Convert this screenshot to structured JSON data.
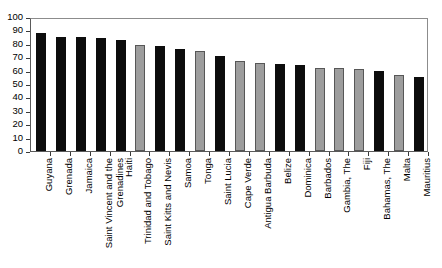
{
  "chart_data": {
    "type": "bar",
    "title": "",
    "subtitle": "",
    "xlabel": "",
    "ylabel": "",
    "ylim": [
      0,
      100
    ],
    "ytick_step": 10,
    "yticks": [
      100,
      90,
      80,
      70,
      60,
      50,
      40,
      30,
      20,
      10,
      0
    ],
    "grid": false,
    "legend": "none",
    "orientation": "vertical",
    "categories": [
      "Guyana",
      "Grenada",
      "Jamaica",
      "Saint Vincent and the Grenadines",
      "Haiti",
      "Trinidad and Tobago",
      "Saint Kitts and Nevis",
      "Samoa",
      "Tonga",
      "Saint Lucia",
      "Cape Verde",
      "Antigua Barbuda",
      "Belize",
      "Dominica",
      "Barbados",
      "Gambia, The",
      "Fiji",
      "Bahamas, The",
      "Malta",
      "Mauritius"
    ],
    "values": [
      88,
      85,
      85,
      84,
      83,
      79,
      78,
      76,
      75,
      71,
      67,
      66,
      65,
      64,
      62,
      62,
      61,
      60,
      57,
      55
    ],
    "bar_colors": [
      "black",
      "black",
      "black",
      "black",
      "black",
      "gray",
      "black",
      "black",
      "gray",
      "black",
      "gray",
      "gray",
      "black",
      "black",
      "gray",
      "gray",
      "gray",
      "black",
      "gray",
      "black"
    ],
    "color_map": {
      "black": "#0d0d0d",
      "gray": "#9d9d9d",
      "gray_border": "#575757"
    }
  }
}
